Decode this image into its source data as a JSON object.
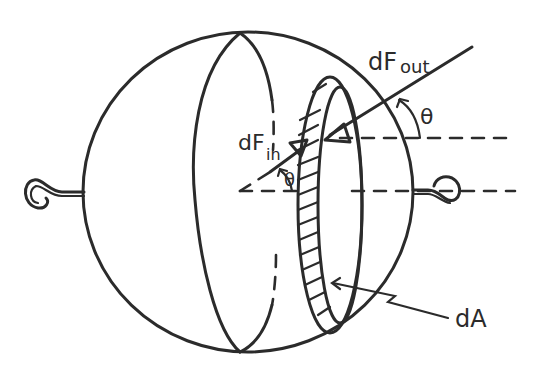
{
  "diagram": {
    "labels": {
      "df_out_main": "dF",
      "df_out_sub": "out",
      "df_in_main": "dF",
      "df_in_sub": "in",
      "theta_outer": "θ",
      "theta_inner": "θ",
      "area": "dA"
    },
    "elements": [
      "sphere-outline",
      "great-circle-ellipse",
      "hatched-ring-dA",
      "hook-left",
      "hook-right",
      "force-line-out",
      "force-arrow-in",
      "horizontal-reference-dashes",
      "angle-arcs"
    ],
    "colors": {
      "ink": "#2b2b2b",
      "background": "#ffffff"
    }
  }
}
